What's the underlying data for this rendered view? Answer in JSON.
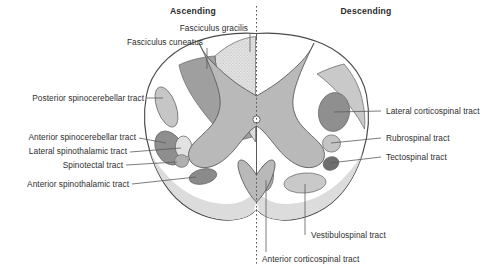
{
  "figure": {
    "headers": {
      "left": "Ascending",
      "right": "Descending"
    }
  },
  "colors": {
    "background": "#ffffff",
    "outline": "#4a4a4a",
    "gray_matter": "#b9b9b9",
    "white_matter": "#ffffff",
    "fasciculus_gracilis": "#d8d8d8",
    "fasciculus_cuneatus": "#9f9f9f",
    "posterior_spinocerebellar": "#c6c6c6",
    "anterior_spinocerebellar": "#8e8e8e",
    "lateral_spinothalamic": "#e2e2e2",
    "spinotectal": "#b0b0b0",
    "anterior_spinothalamic": "#8a8a8a",
    "lateral_corticospinal": "#8f8f8f",
    "rubrospinal": "#c4c4c4",
    "tectospinal": "#6e6e6e",
    "vestibulospinal": "#c9c9c9",
    "anterior_corticospinal": "#a8a8a8",
    "anterior_band": "#dcdcdc",
    "label_text": "#2e2e2e",
    "leader": "#5a5a5a",
    "midline": "#555555"
  },
  "labels": {
    "ascending": [
      {
        "id": "fasciculus-gracilis",
        "text": "Fasciculus gracilis",
        "side": "left"
      },
      {
        "id": "fasciculus-cuneatus",
        "text": "Fasciculus cuneatus",
        "side": "left"
      },
      {
        "id": "posterior-spinocerebellar-tract",
        "text": "Posterior spinocerebellar tract",
        "side": "left"
      },
      {
        "id": "anterior-spinocerebellar-tract",
        "text": "Anterior spinocerebellar tract",
        "side": "left"
      },
      {
        "id": "lateral-spinothalamic-tract",
        "text": "Lateral spinothalamic tract",
        "side": "left"
      },
      {
        "id": "spinotectal-tract",
        "text": "Spinotectal tract",
        "side": "left"
      },
      {
        "id": "anterior-spinothalamic-tract",
        "text": "Anterior spinothalamic tract",
        "side": "left"
      }
    ],
    "descending": [
      {
        "id": "lateral-corticospinal-tract",
        "text": "Lateral corticospinal tract",
        "side": "right"
      },
      {
        "id": "rubrospinal-tract",
        "text": "Rubrospinal tract",
        "side": "right"
      },
      {
        "id": "tectospinal-tract",
        "text": "Tectospinal tract",
        "side": "right"
      },
      {
        "id": "vestibulospinal-tract",
        "text": "Vestibulospinal tract",
        "side": "bottom"
      },
      {
        "id": "anterior-corticospinal-tract",
        "text": "Anterior corticospinal tract",
        "side": "bottom"
      }
    ]
  },
  "label_text": {
    "fasciculus_gracilis": "Fasciculus gracilis",
    "fasciculus_cuneatus": "Fasciculus cuneatus",
    "posterior_spinocerebellar": "Posterior spinocerebellar tract",
    "anterior_spinocerebellar": "Anterior spinocerebellar tract",
    "lateral_spinothalamic": "Lateral spinothalamic tract",
    "spinotectal": "Spinotectal tract",
    "anterior_spinothalamic": "Anterior spinothalamic tract",
    "lateral_corticospinal": "Lateral corticospinal tract",
    "rubrospinal": "Rubrospinal tract",
    "tectospinal": "Tectospinal tract",
    "vestibulospinal": "Vestibulospinal tract",
    "anterior_corticospinal": "Anterior corticospinal tract"
  },
  "structures": {
    "central_canal": "central-canal",
    "gray_matter": "gray-matter-butterfly",
    "midline": "midsagittal-dashed-line"
  }
}
